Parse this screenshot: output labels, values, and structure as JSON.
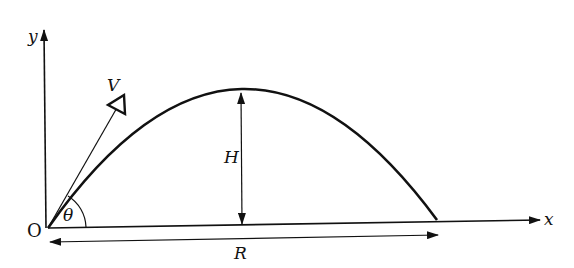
{
  "diagram": {
    "labels": {
      "y_axis": "y",
      "x_axis": "x",
      "origin": "O",
      "velocity": "V",
      "angle": "θ",
      "height": "H",
      "range": "R"
    },
    "colors": {
      "stroke": "#111111",
      "background": "#ffffff"
    }
  }
}
